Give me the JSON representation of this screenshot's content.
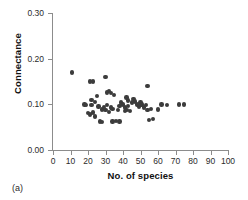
{
  "panel": {
    "label": "(a)"
  },
  "chart_data": {
    "type": "scatter",
    "title": "",
    "xlabel": "No. of species",
    "ylabel": "Connectance",
    "xlim": [
      0,
      100
    ],
    "ylim": [
      0.0,
      0.3
    ],
    "grid": false,
    "legend": null,
    "marker_color": "#3c3c3c",
    "axis_color": "#8c8c8c",
    "xticks": [
      0,
      10,
      20,
      30,
      40,
      50,
      60,
      70,
      80,
      90,
      100
    ],
    "xtick_labels": [
      "0",
      "10",
      "20",
      "30",
      "40",
      "50",
      "60",
      "70",
      "80",
      "90",
      "100"
    ],
    "yticks": [
      0.0,
      0.1,
      0.2,
      0.3
    ],
    "ytick_labels": [
      "0.00",
      "0.10",
      "0.20",
      "0.30"
    ],
    "series": [
      {
        "name": "food webs",
        "x": [
          11,
          18,
          19,
          20,
          21,
          21,
          22,
          22,
          23,
          23,
          24,
          24,
          25,
          26,
          27,
          28,
          28,
          29,
          30,
          30,
          31,
          31,
          32,
          32,
          33,
          33,
          34,
          34,
          35,
          36,
          37,
          38,
          38,
          39,
          40,
          41,
          41,
          42,
          42,
          43,
          43,
          44,
          45,
          46,
          47,
          48,
          49,
          50,
          50,
          51,
          52,
          53,
          54,
          54,
          55,
          56,
          57,
          60,
          62,
          65,
          72,
          75
        ],
        "y": [
          0.17,
          0.1,
          0.098,
          0.081,
          0.15,
          0.078,
          0.11,
          0.098,
          0.15,
          0.082,
          0.105,
          0.073,
          0.118,
          0.095,
          0.062,
          0.089,
          0.061,
          0.094,
          0.16,
          0.088,
          0.126,
          0.099,
          0.129,
          0.083,
          0.125,
          0.093,
          0.062,
          0.09,
          0.12,
          0.063,
          0.087,
          0.062,
          0.097,
          0.104,
          0.1,
          0.093,
          0.086,
          0.115,
          0.088,
          0.108,
          0.097,
          0.086,
          0.104,
          0.112,
          0.106,
          0.1,
          0.095,
          0.104,
          0.098,
          0.1,
          0.093,
          0.098,
          0.14,
          0.087,
          0.066,
          0.09,
          0.068,
          0.089,
          0.1,
          0.098,
          0.1,
          0.1
        ]
      }
    ]
  }
}
